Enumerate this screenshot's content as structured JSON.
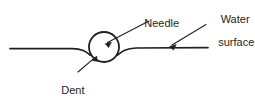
{
  "figure": {
    "name": "needle-on-water-surface-diagram",
    "type": "line-diagram",
    "background_color": "#ffffff",
    "stroke_color": "#231f20",
    "text_color": "#231f20",
    "labels": {
      "needle": "Needle",
      "water_surface_line1": "Water",
      "water_surface_line2": "surface",
      "dent": "Dent"
    },
    "elements": {
      "needle_circle": {
        "center_x": 104,
        "center_y": 47,
        "radius": 15,
        "stroke_width": 1.6
      },
      "water_line_left": {
        "start_x": 10,
        "start_y": 48.5,
        "end_x": 92,
        "end_y": 56
      },
      "water_line_right": {
        "start_x": 116,
        "start_y": 56,
        "end_x": 208,
        "end_y": 47.5
      },
      "leader_needle": {
        "tail_x": 149,
        "tail_y": 21,
        "tip_x": 106,
        "tip_y": 43
      },
      "leader_water_surface": {
        "tail_x": 206,
        "tail_y": 24,
        "tip_x": 170,
        "tip_y": 46
      },
      "leader_dent": {
        "tail_x": 78,
        "tail_y": 72,
        "tip_x": 96,
        "tip_y": 56
      }
    }
  }
}
